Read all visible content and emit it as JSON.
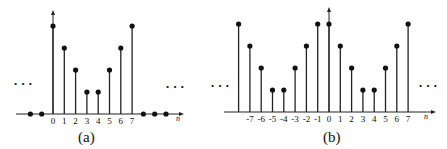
{
  "chart_data": [
    {
      "type": "stem",
      "panel": "a",
      "caption": "(a)",
      "xlabel": "n",
      "ylabel": "",
      "tick_labels": [
        "0",
        "1",
        "2",
        "3",
        "4",
        "5",
        "6",
        "7"
      ],
      "x": [
        -2,
        -1,
        0,
        1,
        2,
        3,
        4,
        5,
        6,
        7,
        8,
        9,
        10
      ],
      "values": [
        0,
        0,
        4,
        3,
        2,
        1,
        1,
        2,
        3,
        4,
        0,
        0,
        0
      ],
      "annotations": [
        "...",
        "..."
      ],
      "grid": false,
      "ylim": [
        0,
        4
      ]
    },
    {
      "type": "stem",
      "panel": "b",
      "caption": "(b)",
      "xlabel": "n",
      "ylabel": "",
      "tick_labels": [
        "-7",
        "-6",
        "-5",
        "-4",
        "-3",
        "-2",
        "-1",
        "0",
        "1",
        "2",
        "3",
        "4",
        "5",
        "6",
        "7"
      ],
      "x": [
        -8,
        -7,
        -6,
        -5,
        -4,
        -3,
        -2,
        -1,
        0,
        1,
        2,
        3,
        4,
        5,
        6,
        7
      ],
      "values": [
        4,
        3,
        2,
        1,
        1,
        2,
        3,
        4,
        4,
        3,
        2,
        1,
        1,
        2,
        3,
        4
      ],
      "annotations": [
        "...",
        "..."
      ],
      "grid": false,
      "ylim": [
        0,
        4
      ]
    }
  ],
  "labels": {
    "ellipsis": "• • •",
    "n": "n",
    "a_caption": "(a)",
    "b_caption": "(b)"
  }
}
